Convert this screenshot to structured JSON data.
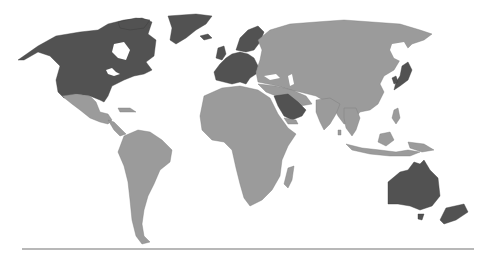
{
  "map": {
    "type": "world-choropleth",
    "style": "grayscale",
    "colors": {
      "highlighted": "#525252",
      "other": "#9b9b9b",
      "background": "#ffffff",
      "baseline": "#b8b8b8"
    },
    "highlighted_regions": [
      "United States",
      "Canada",
      "Greenland",
      "Western Europe",
      "Scandinavia",
      "Saudi Arabia",
      "Japan",
      "South Korea",
      "Australia",
      "New Zealand"
    ],
    "other_regions": [
      "Mexico",
      "Central America",
      "South America",
      "Africa",
      "Russia",
      "Middle East",
      "Central Asia",
      "China",
      "India",
      "Southeast Asia",
      "Indonesia",
      "Madagascar"
    ]
  }
}
